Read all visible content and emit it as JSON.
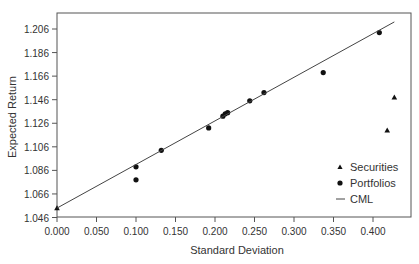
{
  "chart_data": {
    "type": "scatter",
    "title": "",
    "xlabel": "Standard Deviation",
    "ylabel": "Expected Return",
    "xlim": [
      0.0,
      0.448
    ],
    "ylim": [
      1.046,
      1.212
    ],
    "x_ticks": [
      "0.000",
      "0.050",
      "0.100",
      "0.150",
      "0.200",
      "0.250",
      "0.300",
      "0.350",
      "0.400"
    ],
    "y_ticks": [
      "1.046",
      "1.066",
      "1.086",
      "1.106",
      "1.126",
      "1.146",
      "1.166",
      "1.186",
      "1.206"
    ],
    "grid": false,
    "legend_position": "lower right",
    "series": [
      {
        "name": "Securities",
        "marker": "triangle",
        "points": [
          {
            "x": 0.0,
            "y": 1.054
          },
          {
            "x": 0.418,
            "y": 1.12
          },
          {
            "x": 0.427,
            "y": 1.148
          }
        ]
      },
      {
        "name": "Portfolios",
        "marker": "circle",
        "points": [
          {
            "x": 0.1,
            "y": 1.078
          },
          {
            "x": 0.1,
            "y": 1.089
          },
          {
            "x": 0.132,
            "y": 1.103
          },
          {
            "x": 0.192,
            "y": 1.122
          },
          {
            "x": 0.21,
            "y": 1.132
          },
          {
            "x": 0.213,
            "y": 1.134
          },
          {
            "x": 0.216,
            "y": 1.135
          },
          {
            "x": 0.244,
            "y": 1.145
          },
          {
            "x": 0.262,
            "y": 1.152
          },
          {
            "x": 0.337,
            "y": 1.169
          },
          {
            "x": 0.408,
            "y": 1.203
          }
        ]
      },
      {
        "name": "CML",
        "marker": "line",
        "points": [
          {
            "x": 0.0,
            "y": 1.054
          },
          {
            "x": 0.427,
            "y": 1.212
          }
        ]
      }
    ]
  },
  "legend": {
    "items": [
      {
        "label": "Securities",
        "symbol": "triangle"
      },
      {
        "label": "Portfolios",
        "symbol": "circle"
      },
      {
        "label": "CML",
        "symbol": "line"
      }
    ]
  },
  "colors": {
    "frame": "#555555",
    "marker": "#111111",
    "line": "#444444",
    "text": "#333333"
  }
}
